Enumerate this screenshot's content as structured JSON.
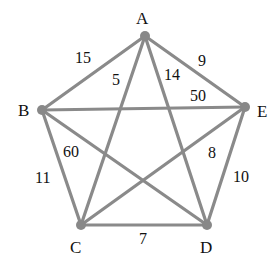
{
  "graph": {
    "type": "complete-weighted-undirected",
    "colors": {
      "edge": "#8a8a8a",
      "node": "#888888",
      "text": "#111111",
      "background": "#ffffff"
    },
    "nodes": [
      {
        "id": "A",
        "label": "A",
        "x": 145,
        "y": 36,
        "lx": 136,
        "ly": 24
      },
      {
        "id": "B",
        "label": "B",
        "x": 42,
        "y": 110,
        "lx": 18,
        "ly": 116
      },
      {
        "id": "C",
        "label": "C",
        "x": 81,
        "y": 225,
        "lx": 70,
        "ly": 253
      },
      {
        "id": "D",
        "label": "D",
        "x": 207,
        "y": 225,
        "lx": 200,
        "ly": 253
      },
      {
        "id": "E",
        "label": "E",
        "x": 245,
        "y": 107,
        "lx": 257,
        "ly": 117
      }
    ],
    "edges": [
      {
        "from": "A",
        "to": "B",
        "weight": "15",
        "lx": 75,
        "ly": 63
      },
      {
        "from": "A",
        "to": "C",
        "weight": "5",
        "lx": 112,
        "ly": 85
      },
      {
        "from": "A",
        "to": "D",
        "weight": "14",
        "lx": 164,
        "ly": 80
      },
      {
        "from": "A",
        "to": "E",
        "weight": "9",
        "lx": 198,
        "ly": 66
      },
      {
        "from": "B",
        "to": "E",
        "weight": "50",
        "lx": 190,
        "ly": 101
      },
      {
        "from": "B",
        "to": "D",
        "weight": "60",
        "lx": 63,
        "ly": 157
      },
      {
        "from": "B",
        "to": "C",
        "weight": "11",
        "lx": 35,
        "ly": 183
      },
      {
        "from": "C",
        "to": "E",
        "weight": "8",
        "lx": 208,
        "ly": 158
      },
      {
        "from": "C",
        "to": "D",
        "weight": "7",
        "lx": 139,
        "ly": 244
      },
      {
        "from": "D",
        "to": "E",
        "weight": "10",
        "lx": 233,
        "ly": 182
      }
    ]
  }
}
